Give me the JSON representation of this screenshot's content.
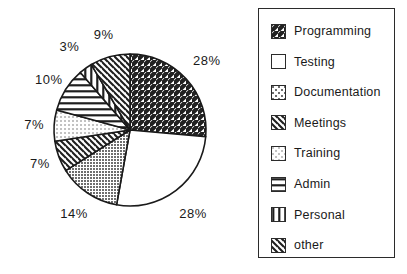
{
  "chart_data": {
    "type": "pie",
    "title": "",
    "xlabel": "",
    "ylabel": "",
    "legend_position": "right",
    "grid": false,
    "value_suffix": "%",
    "categories": [
      "Programming",
      "Testing",
      "Documentation",
      "Meetings",
      "Training",
      "Admin",
      "Personal",
      "other"
    ],
    "values": [
      28,
      28,
      14,
      7,
      7,
      10,
      3,
      9
    ],
    "labels": [
      "28%",
      "28%",
      "14%",
      "7%",
      "7%",
      "10%",
      "3%",
      "9%"
    ],
    "patterns": [
      "forward-diagonal-hatch",
      "solid-white",
      "dark-dotted",
      "backward-diagonal-hatch",
      "light-dotted",
      "horizontal-lines",
      "vertical-lines",
      "backward-diagonal-hatch"
    ],
    "slices": [
      {
        "name": "Programming",
        "value": 28,
        "label": "28%",
        "pattern": "forward-diagonal-hatch"
      },
      {
        "name": "Testing",
        "value": 28,
        "label": "28%",
        "pattern": "solid-white"
      },
      {
        "name": "Documentation",
        "value": 14,
        "label": "14%",
        "pattern": "dark-dotted"
      },
      {
        "name": "Meetings",
        "value": 7,
        "label": "7%",
        "pattern": "backward-diagonal-hatch"
      },
      {
        "name": "Training",
        "value": 7,
        "label": "7%",
        "pattern": "light-dotted"
      },
      {
        "name": "Admin",
        "value": 10,
        "label": "10%",
        "pattern": "horizontal-lines"
      },
      {
        "name": "Personal",
        "value": 3,
        "label": "3%",
        "pattern": "vertical-lines"
      },
      {
        "name": "other",
        "value": 9,
        "label": "9%",
        "pattern": "backward-diagonal-hatch"
      }
    ],
    "colors": {
      "stroke": "#1a1a1a",
      "background": "#ffffff",
      "text": "#1a1a1a",
      "dark_fill": "#8a8a8a",
      "light_fill": "#d0d0d0"
    }
  },
  "legend": {
    "items": [
      {
        "label": "Programming",
        "pattern": "forward-diagonal-hatch"
      },
      {
        "label": "Testing",
        "pattern": "solid-white"
      },
      {
        "label": "Documentation",
        "pattern": "dark-dotted"
      },
      {
        "label": "Meetings",
        "pattern": "backward-diagonal-hatch"
      },
      {
        "label": "Training",
        "pattern": "light-dotted"
      },
      {
        "label": "Admin",
        "pattern": "horizontal-lines"
      },
      {
        "label": "Personal",
        "pattern": "vertical-lines"
      },
      {
        "label": "other",
        "pattern": "backward-diagonal-hatch"
      }
    ]
  }
}
